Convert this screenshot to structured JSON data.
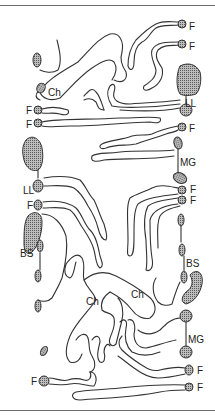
{
  "figure": {
    "type": "anatomical schematic line drawing",
    "colors": {
      "line": "#333333",
      "stipple": "#888888",
      "background": "#ffffff",
      "rule": "#6e6e6e"
    },
    "labels": [
      {
        "id": "f-top-right-1",
        "text": "F",
        "x": 189,
        "y": 22
      },
      {
        "id": "f-top-right-2",
        "text": "F",
        "x": 189,
        "y": 42
      },
      {
        "id": "ch-upper-left",
        "text": "Ch",
        "x": 48,
        "y": 88
      },
      {
        "id": "ll-right",
        "text": "LL",
        "x": 185,
        "y": 99
      },
      {
        "id": "f-left-1",
        "text": "F",
        "x": 26,
        "y": 106
      },
      {
        "id": "f-left-2",
        "text": "F",
        "x": 26,
        "y": 120
      },
      {
        "id": "f-right-3",
        "text": "F",
        "x": 189,
        "y": 124
      },
      {
        "id": "mg-upper-right",
        "text": "MG",
        "x": 180,
        "y": 158
      },
      {
        "id": "ll-left",
        "text": "LL",
        "x": 23,
        "y": 186
      },
      {
        "id": "f-right-4",
        "text": "F",
        "x": 190,
        "y": 185
      },
      {
        "id": "f-right-5",
        "text": "F",
        "x": 190,
        "y": 196
      },
      {
        "id": "f-left-3",
        "text": "F",
        "x": 27,
        "y": 201
      },
      {
        "id": "bs-left",
        "text": "BS",
        "x": 20,
        "y": 249
      },
      {
        "id": "bs-right",
        "text": "BS",
        "x": 186,
        "y": 259
      },
      {
        "id": "ch-lower-right",
        "text": "Ch",
        "x": 131,
        "y": 290
      },
      {
        "id": "ch-lower-left",
        "text": "Ch",
        "x": 86,
        "y": 297
      },
      {
        "id": "mg-lower-right",
        "text": "MG",
        "x": 188,
        "y": 335
      },
      {
        "id": "f-right-6",
        "text": "F",
        "x": 197,
        "y": 366
      },
      {
        "id": "f-right-7",
        "text": "F",
        "x": 197,
        "y": 383
      },
      {
        "id": "f-left-4",
        "text": "F",
        "x": 31,
        "y": 377
      }
    ],
    "legend_terms": [
      "F",
      "Ch",
      "LL",
      "MG",
      "BS"
    ]
  }
}
